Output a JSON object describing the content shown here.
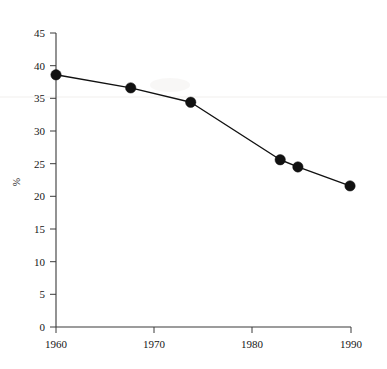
{
  "chart_data": {
    "type": "line",
    "title": "",
    "xlabel": "",
    "ylabel": "%",
    "xlim": [
      1960,
      1990
    ],
    "ylim": [
      0,
      45
    ],
    "grid": false,
    "legend": null,
    "x_ticks": [
      1960,
      1970,
      1980,
      1990
    ],
    "x_tick_labels": [
      "1960",
      "1970",
      "1980",
      "1990"
    ],
    "y_ticks": [
      0,
      5,
      10,
      15,
      20,
      25,
      30,
      35,
      40,
      45
    ],
    "y_tick_labels": [
      "0",
      "5",
      "10",
      "15",
      "20",
      "25",
      "30",
      "35",
      "40",
      "45"
    ],
    "series": [
      {
        "name": "",
        "marker": "filled-circle",
        "color": "#111111",
        "x": [
          1960.0,
          1967.6,
          1973.7,
          1982.8,
          1984.6,
          1989.9
        ],
        "values": [
          38.6,
          36.6,
          34.4,
          25.6,
          24.5,
          21.6
        ],
        "points": [
          {
            "x": 1960.0,
            "y": 38.6
          },
          {
            "x": 1967.6,
            "y": 36.6
          },
          {
            "x": 1973.7,
            "y": 34.4
          },
          {
            "x": 1982.8,
            "y": 25.6
          },
          {
            "x": 1984.6,
            "y": 24.5
          },
          {
            "x": 1989.9,
            "y": 21.6
          }
        ]
      }
    ]
  },
  "axes": {
    "y_axis_title": "%"
  }
}
